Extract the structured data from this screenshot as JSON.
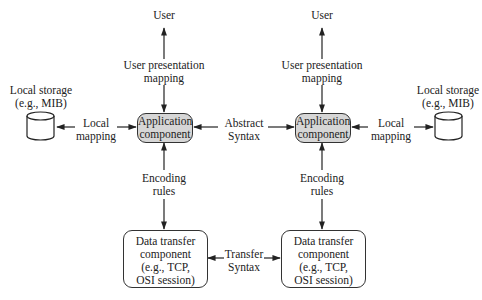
{
  "diagram": {
    "left": {
      "user": "User",
      "presentation_mapping": [
        "User presentation",
        "mapping"
      ],
      "storage": [
        "Local storage",
        "(e.g., MIB)"
      ],
      "local_mapping": [
        "Local",
        "mapping"
      ],
      "app_component": [
        "Application",
        "component"
      ],
      "encoding_rules": [
        "Encoding",
        "rules"
      ],
      "data_transfer": [
        "Data transfer",
        "component",
        "(e.g., TCP,",
        "OSI session)"
      ]
    },
    "right": {
      "user": "User",
      "presentation_mapping": [
        "User presentation",
        "mapping"
      ],
      "storage": [
        "Local storage",
        "(e.g., MIB)"
      ],
      "local_mapping": [
        "Local",
        "mapping"
      ],
      "app_component": [
        "Application",
        "component"
      ],
      "encoding_rules": [
        "Encoding",
        "rules"
      ],
      "data_transfer": [
        "Data transfer",
        "component",
        "(e.g., TCP,",
        "OSI session)"
      ]
    },
    "abstract_syntax": [
      "Abstract",
      "Syntax"
    ],
    "transfer_syntax": [
      "Transfer",
      "Syntax"
    ],
    "colors": {
      "app_fill": "#d6d6d6",
      "stroke": "#333333"
    }
  }
}
